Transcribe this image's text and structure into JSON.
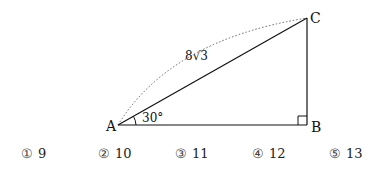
{
  "diagram": {
    "vertices": {
      "A": "A",
      "B": "B",
      "C": "C"
    },
    "hypotenuse_label": "8√3",
    "angle_label": "30°",
    "right_angle_at": "B"
  },
  "choices": [
    {
      "marker": "①",
      "value": "9"
    },
    {
      "marker": "②",
      "value": "10"
    },
    {
      "marker": "③",
      "value": "11"
    },
    {
      "marker": "④",
      "value": "12"
    },
    {
      "marker": "⑤",
      "value": "13"
    }
  ]
}
